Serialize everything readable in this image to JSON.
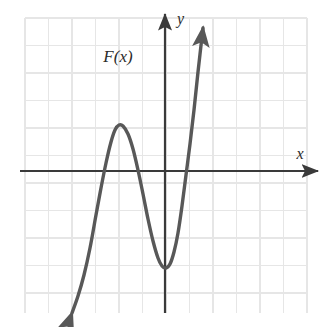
{
  "figure": {
    "name": "cartesian-graph",
    "background_color": "#ffffff"
  },
  "labels": {
    "curve_label": "F(x)",
    "x_axis_label": "x",
    "y_axis_label": "y"
  },
  "colors": {
    "curve": "#585858",
    "axis": "#3a3a3a",
    "grid": "#e6e6e6",
    "text": "#2b2b2b"
  },
  "chart_data": {
    "type": "line",
    "title": "F(x)",
    "xlabel": "x",
    "ylabel": "y",
    "grid": true,
    "legend": null,
    "axes": {
      "x_axis_pixel_y": 171,
      "y_axis_pixel_x": 165,
      "x_axis_arrow": "right",
      "y_axis_arrow": "up",
      "grid_x_start": 25,
      "grid_x_end": 307,
      "grid_y_start": 18,
      "grid_y_end": 313,
      "grid_spacing_x": 23.5,
      "grid_spacing_y": 27.5,
      "xlim": [
        -6,
        6
      ],
      "ylim": [
        -5.5,
        5.5
      ],
      "tick_labels_shown": false
    },
    "annotations": [
      {
        "text": "F(x)",
        "x_px": 118,
        "y_px": 62
      },
      {
        "text": "y",
        "x_px": 176,
        "y_px": 19
      },
      {
        "text": "x",
        "x_px": 300,
        "y_px": 156
      }
    ],
    "series": [
      {
        "name": "F(x)",
        "shape": "cubic-polynomial",
        "stroke_color": "#585858",
        "stroke_width": 3.4,
        "arrow_start": "down-left",
        "arrow_end": "up-right",
        "features": {
          "x_intercepts_px": [
            95,
            142,
            190
          ],
          "local_maximum_px": [
            118,
            125
          ],
          "local_minimum_px": [
            166,
            268
          ],
          "start_point_px": [
            72,
            313
          ],
          "end_point_px": [
            203,
            28
          ]
        },
        "points_px": [
          [
            72,
            313
          ],
          [
            78,
            296
          ],
          [
            84,
            275
          ],
          [
            90,
            248
          ],
          [
            96,
            215
          ],
          [
            101,
            188
          ],
          [
            106,
            163
          ],
          [
            111,
            142
          ],
          [
            115,
            130
          ],
          [
            119,
            125
          ],
          [
            123,
            126
          ],
          [
            128,
            134
          ],
          [
            133,
            149
          ],
          [
            138,
            170
          ],
          [
            143,
            194
          ],
          [
            148,
            219
          ],
          [
            153,
            241
          ],
          [
            158,
            258
          ],
          [
            162,
            266
          ],
          [
            166,
            268
          ],
          [
            170,
            264
          ],
          [
            174,
            252
          ],
          [
            178,
            233
          ],
          [
            182,
            206
          ],
          [
            186,
            175
          ],
          [
            190,
            144
          ],
          [
            194,
            110
          ],
          [
            198,
            72
          ],
          [
            203,
            28
          ]
        ]
      }
    ]
  }
}
